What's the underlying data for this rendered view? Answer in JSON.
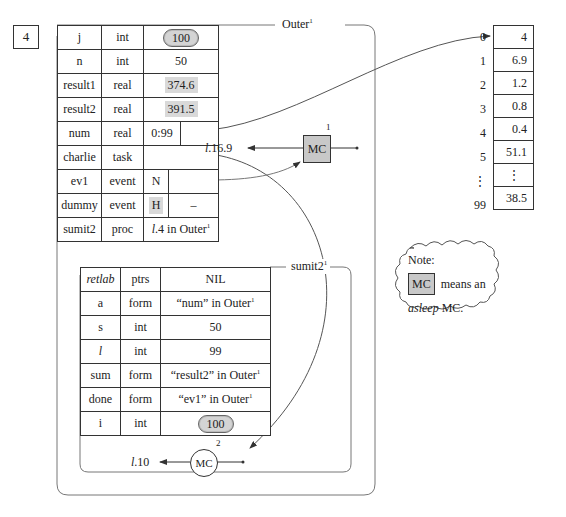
{
  "counter": "4",
  "outer": {
    "title": "Outer",
    "title_sup": "1",
    "rows": [
      {
        "name": "j",
        "type": "int",
        "value": "100",
        "style": "cloud"
      },
      {
        "name": "n",
        "type": "int",
        "value": "50",
        "style": "plain"
      },
      {
        "name": "result1",
        "type": "real",
        "value": "374.6",
        "style": "shaded"
      },
      {
        "name": "result2",
        "type": "real",
        "value": "391.5",
        "style": "shaded"
      },
      {
        "name": "num",
        "type": "real",
        "value": "0:99",
        "value2": "",
        "style": "split-pointer"
      },
      {
        "name": "charlie",
        "type": "task",
        "value": "",
        "style": "pointer"
      },
      {
        "name": "ev1",
        "type": "event",
        "value": "N",
        "value2": "",
        "style": "split-pointer"
      },
      {
        "name": "dummy",
        "type": "event",
        "value": "H",
        "value2": "–",
        "style": "split-shaded"
      },
      {
        "name": "sumit2",
        "type": "proc",
        "value_italic": "l",
        "value": ".4 in Outer",
        "value_sup": "1",
        "style": "ref"
      }
    ],
    "mc": {
      "label": "MC",
      "sup": "1",
      "target_prefix": "l",
      "target": ".16.9"
    }
  },
  "inner": {
    "title": "sumit2",
    "title_sup": "1",
    "rows": [
      {
        "name": "retlab",
        "name_italic": true,
        "type": "ptrs",
        "value": "NIL"
      },
      {
        "name": "a",
        "type": "form",
        "value": "“num” in Outer",
        "value_sup": "1"
      },
      {
        "name": "s",
        "type": "int",
        "value": "50"
      },
      {
        "name": "l",
        "name_italic": true,
        "type": "int",
        "value": "99"
      },
      {
        "name": "sum",
        "type": "form",
        "value": "“result2” in Outer",
        "value_sup": "1"
      },
      {
        "name": "done",
        "type": "form",
        "value": "“ev1” in Outer",
        "value_sup": "1"
      },
      {
        "name": "i",
        "type": "int",
        "value": "100",
        "style": "cloud"
      }
    ],
    "mc": {
      "label": "MC",
      "sup": "2",
      "target_prefix": "l",
      "target": ".10"
    }
  },
  "array": {
    "indices": [
      "0",
      "1",
      "2",
      "3",
      "4",
      "5",
      "⋮",
      "99"
    ],
    "values": [
      "4",
      "6.9",
      "1.2",
      "0.8",
      "0.4",
      "51.1",
      "⋮",
      "38.5"
    ]
  },
  "note": {
    "title": "Note:",
    "mc_label": "MC",
    "line1": "means an",
    "line2_italic": "asleep",
    "line2": " MC."
  },
  "colors": {
    "shade": "#d9d9d9",
    "mc_asleep": "#c8c8c8",
    "line": "#333333"
  }
}
